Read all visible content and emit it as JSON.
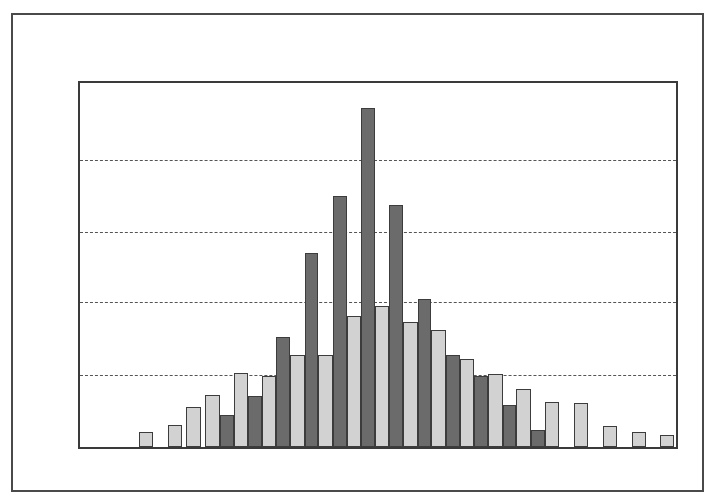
{
  "figure": {
    "title": "",
    "background_color": "#ffffff",
    "outer_border_color": "#4a4a4a",
    "plot_border_color": "#3a3a3a"
  },
  "chart_data": {
    "type": "bar",
    "title": "",
    "subtitle": "",
    "xlabel": "",
    "ylabel": "",
    "grid": true,
    "grid_axis": "y",
    "grid_style": "dashed",
    "legend": false,
    "legend_position": "none",
    "xlim": [
      0,
      24
    ],
    "ylim": [
      0,
      5.15
    ],
    "yticks": [
      1,
      2,
      3,
      4
    ],
    "ytick_labels": [
      "",
      "",
      "",
      ""
    ],
    "xtick_labels": [],
    "series": [
      {
        "name": "Series 1 (dark)",
        "color": "#6b6b6b",
        "edge_color": "#3c3c3c",
        "values": [
          0,
          0,
          0,
          0,
          0.46,
          0.72,
          1.55,
          2.75,
          3.55,
          4.79,
          3.42,
          2.1,
          1.3,
          1.0,
          0.59,
          0.24,
          0,
          0,
          0,
          0
        ]
      },
      {
        "name": "Series 2 (light)",
        "color": "#d2d2d2",
        "edge_color": "#3c3c3c",
        "values": [
          0.21,
          0.31,
          0.56,
          0.74,
          1.05,
          1.0,
          1.3,
          1.3,
          1.86,
          2.0,
          1.77,
          1.65,
          1.25,
          0.82,
          1.04,
          0.63,
          0.62,
          0.0,
          0.21,
          0.17
        ]
      }
    ],
    "bars": [
      {
        "index": 0,
        "series": "light",
        "value": 0.21,
        "x_px": 77,
        "width_px": 18,
        "height_px": 21
      },
      {
        "index": 1,
        "series": "light",
        "value": 0.31,
        "x_px": 115,
        "width_px": 18,
        "height_px": 31
      },
      {
        "index": 2,
        "series": "light",
        "value": 0.56,
        "x_px": 139,
        "width_px": 19,
        "height_px": 56
      },
      {
        "index": 3,
        "series": "light",
        "value": 0.74,
        "x_px": 164,
        "width_px": 19,
        "height_px": 74
      },
      {
        "index": 4,
        "series": "dark",
        "value": 0.46,
        "x_px": 183,
        "width_px": 18,
        "height_px": 46
      },
      {
        "index": 5,
        "series": "light",
        "value": 1.05,
        "x_px": 201,
        "width_px": 19,
        "height_px": 105
      },
      {
        "index": 6,
        "series": "dark",
        "value": 0.72,
        "x_px": 220,
        "width_px": 18,
        "height_px": 72
      },
      {
        "index": 7,
        "series": "light",
        "value": 1.0,
        "x_px": 238,
        "width_px": 19,
        "height_px": 100
      },
      {
        "index": 8,
        "series": "dark",
        "value": 1.55,
        "x_px": 257,
        "width_px": 18,
        "height_px": 155
      },
      {
        "index": 9,
        "series": "light",
        "value": 1.3,
        "x_px": 275,
        "width_px": 19,
        "height_px": 130
      },
      {
        "index": 10,
        "series": "dark",
        "value": 2.75,
        "x_px": 294,
        "width_px": 18,
        "height_px": 275
      },
      {
        "index": 11,
        "series": "light",
        "value": 1.3,
        "x_px": 312,
        "width_px": 19,
        "height_px": 130
      },
      {
        "index": 12,
        "series": "dark",
        "value": 3.55,
        "x_px": 331,
        "width_px": 18,
        "height_px": 355
      },
      {
        "index": 13,
        "series": "light",
        "value": 1.86,
        "x_px": 349,
        "width_px": 19,
        "height_px": 186
      },
      {
        "index": 14,
        "series": "dark",
        "value": 4.79,
        "x_px": 368,
        "width_px": 18,
        "height_px": 479
      },
      {
        "index": 15,
        "series": "light",
        "value": 2.0,
        "x_px": 386,
        "width_px": 19,
        "height_px": 200
      },
      {
        "index": 16,
        "series": "dark",
        "value": 3.42,
        "x_px": 405,
        "width_px": 18,
        "height_px": 342
      },
      {
        "index": 17,
        "series": "light",
        "value": 1.77,
        "x_px": 423,
        "width_px": 19,
        "height_px": 177
      },
      {
        "index": 18,
        "series": "dark",
        "value": 2.1,
        "x_px": 442,
        "width_px": 18,
        "height_px": 210
      },
      {
        "index": 19,
        "series": "light",
        "value": 1.65,
        "x_px": 460,
        "width_px": 19,
        "height_px": 165
      },
      {
        "index": 20,
        "series": "dark",
        "value": 1.3,
        "x_px": 479,
        "width_px": 18,
        "height_px": 130
      },
      {
        "index": 21,
        "series": "light",
        "value": 1.25,
        "x_px": 497,
        "width_px": 19,
        "height_px": 125
      },
      {
        "index": 22,
        "series": "dark",
        "value": 1.0,
        "x_px": 516,
        "width_px": 18,
        "height_px": 100
      },
      {
        "index": 23,
        "series": "light",
        "value": 1.04,
        "x_px": 534,
        "width_px": 19,
        "height_px": 104
      },
      {
        "index": 24,
        "series": "dark",
        "value": 0.59,
        "x_px": 553,
        "width_px": 18,
        "height_px": 59
      },
      {
        "index": 25,
        "series": "light",
        "value": 0.82,
        "x_px": 571,
        "width_px": 19,
        "height_px": 82
      },
      {
        "index": 26,
        "series": "dark",
        "value": 0.24,
        "x_px": 590,
        "width_px": 18,
        "height_px": 24
      },
      {
        "index": 27,
        "series": "light",
        "value": 0.63,
        "x_px": 608,
        "width_px": 19,
        "height_px": 63
      },
      {
        "index": 28,
        "series": "light",
        "value": 0.62,
        "x_px": 646,
        "width_px": 19,
        "height_px": 62
      },
      {
        "index": 29,
        "series": "light",
        "value": 0.3,
        "x_px": 684,
        "width_px": 19,
        "height_px": 30
      },
      {
        "index": 30,
        "series": "light",
        "value": 0.21,
        "x_px": 722,
        "width_px": 19,
        "height_px": 21
      },
      {
        "index": 31,
        "series": "light",
        "value": 0.17,
        "x_px": 759,
        "width_px": 19,
        "height_px": 17
      }
    ],
    "gridline_y_px": [
      77,
      149,
      219,
      292
    ],
    "plot_px": {
      "left": 65,
      "top": 66,
      "width": 600,
      "height": 368,
      "baseline_y": 434
    }
  }
}
